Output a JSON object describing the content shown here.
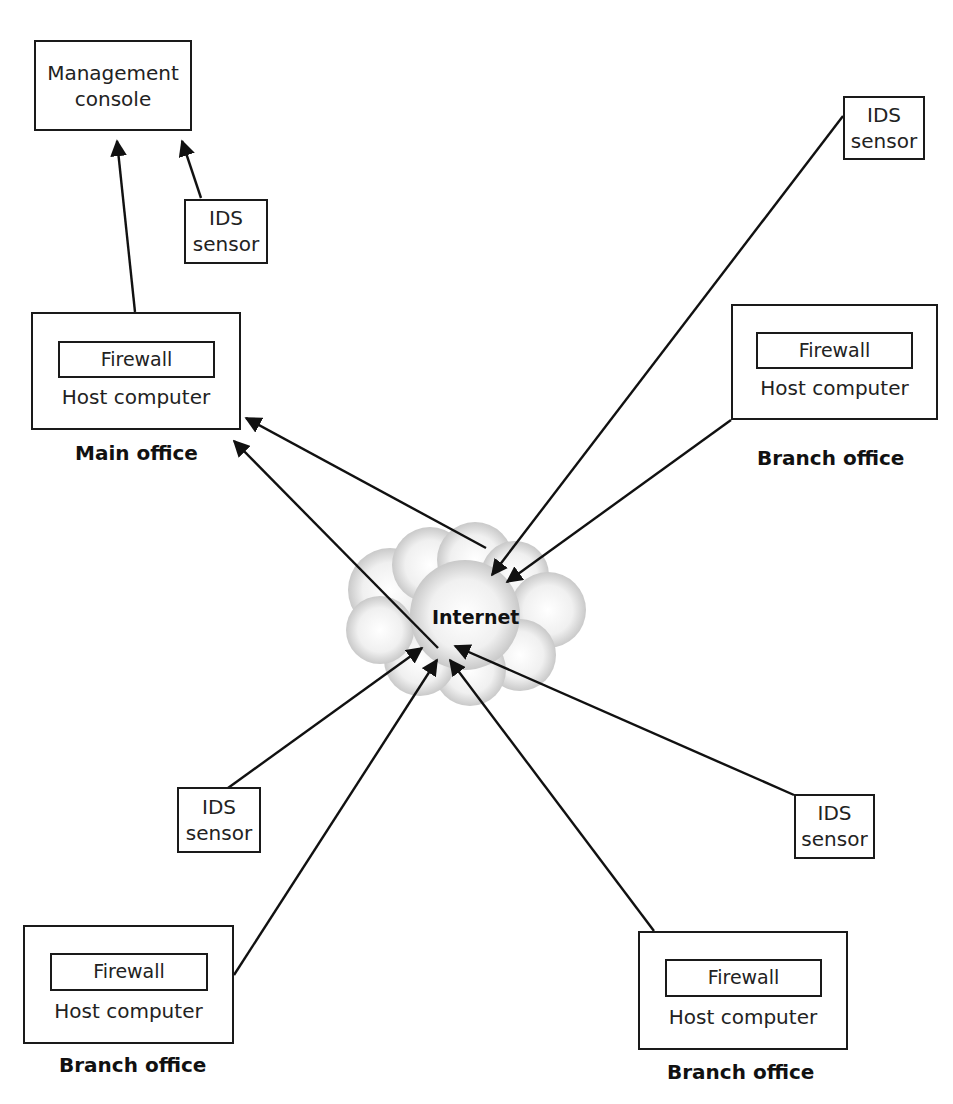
{
  "diagram": {
    "type": "network-topology",
    "nodes": {
      "management_console": {
        "line1": "Management",
        "line2": "console"
      },
      "ids_top_left": {
        "line1": "IDS",
        "line2": "sensor"
      },
      "ids_top_right": {
        "line1": "IDS",
        "line2": "sensor"
      },
      "ids_bottom_left": {
        "line1": "IDS",
        "line2": "sensor"
      },
      "ids_bottom_right": {
        "line1": "IDS",
        "line2": "sensor"
      },
      "main_office": {
        "firewall": "Firewall",
        "host": "Host computer",
        "label": "Main office"
      },
      "branch_top_right": {
        "firewall": "Firewall",
        "host": "Host computer",
        "label": "Branch office"
      },
      "branch_bottom_left": {
        "firewall": "Firewall",
        "host": "Host computer",
        "label": "Branch office"
      },
      "branch_bottom_right": {
        "firewall": "Firewall",
        "host": "Host computer",
        "label": "Branch office"
      },
      "internet": {
        "label": "Internet"
      }
    },
    "edges": [
      {
        "from": "main_office",
        "to": "management_console",
        "arrow": "to"
      },
      {
        "from": "ids_top_left",
        "to": "management_console",
        "arrow": "to"
      },
      {
        "from": "internet",
        "to": "main_office",
        "arrow": "to"
      },
      {
        "from": "internet",
        "to": "main_office",
        "arrow": "to"
      },
      {
        "from": "ids_top_right",
        "to": "internet",
        "arrow": "to"
      },
      {
        "from": "branch_top_right",
        "to": "internet",
        "arrow": "to"
      },
      {
        "from": "ids_bottom_left",
        "to": "internet",
        "arrow": "to"
      },
      {
        "from": "branch_bottom_left",
        "to": "internet",
        "arrow": "to"
      },
      {
        "from": "branch_bottom_right",
        "to": "internet",
        "arrow": "to"
      },
      {
        "from": "ids_bottom_right",
        "to": "internet",
        "arrow": "to"
      }
    ]
  }
}
